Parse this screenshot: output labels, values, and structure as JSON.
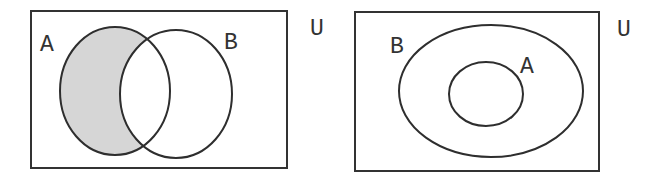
{
  "diagrams": [
    {
      "name": "A minus B",
      "universe_label": "U",
      "set_a_label": "A",
      "set_b_label": "B",
      "shaded_region": "A \\ B",
      "relationship": "overlapping"
    },
    {
      "name": "A subset of B",
      "universe_label": "U",
      "set_a_label": "A",
      "set_b_label": "B",
      "shaded_region": "none",
      "relationship": "A inside B"
    }
  ],
  "colors": {
    "shade": "#d6d6d6",
    "stroke": "#2e2e2e",
    "background": "#ffffff"
  }
}
